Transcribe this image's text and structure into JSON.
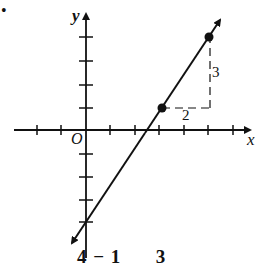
{
  "figure": {
    "marker": "•",
    "axes": {
      "x_label": "x",
      "y_label": "y",
      "origin_label": "O",
      "x_ticks": [
        -3,
        -2,
        -1,
        1,
        2,
        3,
        4,
        5,
        6
      ],
      "y_ticks": [
        -5,
        -4,
        -3,
        -2,
        -1,
        1,
        2,
        3,
        4
      ]
    },
    "line": {
      "equation": "y = (3/2)x - 7/2",
      "slope": 1.5,
      "points": [
        {
          "x": 3,
          "y": 1
        },
        {
          "x": 5,
          "y": 4
        }
      ]
    },
    "slope_triangle": {
      "rise_label": "3",
      "run_label": "2"
    },
    "caption_fragment": "4 − 1      3"
  },
  "colors": {
    "ink": "#111111",
    "background": "#ffffff"
  }
}
